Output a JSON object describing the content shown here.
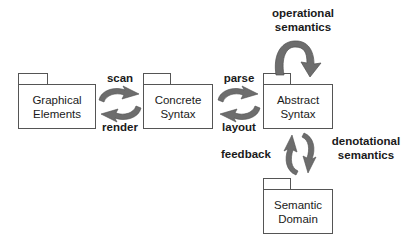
{
  "diagram": {
    "background_color": "#ffffff",
    "box_border_color": "#555555",
    "text_color": "#1a1a1a",
    "arrow_color": "#6d6d6d",
    "arrow_color_dark": "#5a5a5a",
    "packages": [
      {
        "id": "graphical-elements",
        "name": "graphical-elements-package",
        "line1": "Graphical",
        "line2": "Elements"
      },
      {
        "id": "concrete-syntax",
        "name": "concrete-syntax-package",
        "line1": "Concrete",
        "line2": "Syntax"
      },
      {
        "id": "abstract-syntax",
        "name": "abstract-syntax-package",
        "line1": "Abstract",
        "line2": "Syntax"
      },
      {
        "id": "semantic-domain",
        "name": "semantic-domain-package",
        "line1": "Semantic",
        "line2": "Domain"
      }
    ],
    "edge_labels": {
      "scan": "scan",
      "render": "render",
      "parse": "parse",
      "layout": "layout",
      "feedback": "feedback",
      "operational_line1": "operational",
      "operational_line2": "semantics",
      "denotational_line1": "denotational",
      "denotational_line2": "semantics"
    },
    "relations": [
      {
        "from": "Graphical Elements",
        "to": "Concrete Syntax",
        "label": "scan"
      },
      {
        "from": "Concrete Syntax",
        "to": "Graphical Elements",
        "label": "render"
      },
      {
        "from": "Concrete Syntax",
        "to": "Abstract Syntax",
        "label": "parse"
      },
      {
        "from": "Abstract Syntax",
        "to": "Concrete Syntax",
        "label": "layout"
      },
      {
        "from": "Abstract Syntax",
        "to": "Abstract Syntax",
        "label": "operational semantics"
      },
      {
        "from": "Abstract Syntax",
        "to": "Semantic Domain",
        "label": "denotational semantics"
      },
      {
        "from": "Semantic Domain",
        "to": "Abstract Syntax",
        "label": "feedback"
      }
    ]
  }
}
